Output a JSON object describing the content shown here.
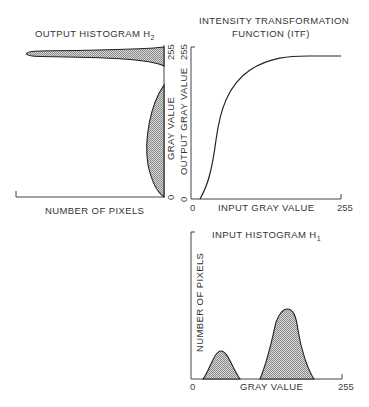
{
  "output_histogram": {
    "title": "OUTPUT HISTOGRAM H",
    "title_sub": "2",
    "x_axis_label": "NUMBER OF PIXELS",
    "y_axis_label": "GRAY VALUE",
    "y_tick_min": "0",
    "y_tick_max": "255"
  },
  "itf": {
    "title_line1": "INTENSITY TRANSFORMATION",
    "title_line2": "FUNCTION (ITF)",
    "x_axis_label": "INPUT GRAY VALUE",
    "y_axis_label": "OUTPUT GRAY VALUE",
    "x_tick_min": "0",
    "x_tick_max": "255",
    "y_tick_min": "0",
    "y_tick_max": "255"
  },
  "input_histogram": {
    "title": "INPUT HISTOGRAM H",
    "title_sub": "1",
    "x_axis_label": "GRAY VALUE",
    "y_axis_label": "NUMBER OF PIXELS",
    "x_tick_min": "0",
    "x_tick_max": "255"
  },
  "colors": {
    "line": "#222222",
    "axis": "#444444",
    "shade": "#9a9a9a",
    "background": "#ffffff"
  }
}
